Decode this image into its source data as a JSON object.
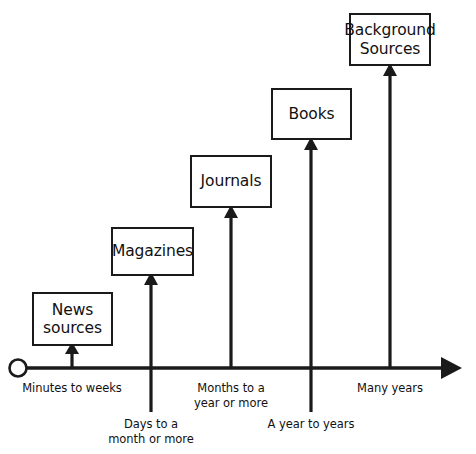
{
  "diagram": {
    "type": "information-timeline",
    "background_color": "#ffffff",
    "line_color": "#1a1a1a",
    "axis": {
      "name": "time-axis",
      "origin_marker": "open-circle",
      "direction": "left-to-right",
      "arrowhead": "right"
    },
    "stages": [
      {
        "box_label": "News\nsources",
        "axis_label": "Minutes to weeks",
        "label_position": "above-axis"
      },
      {
        "box_label": "Magazines",
        "axis_label": "Days to a\nmonth or more",
        "label_position": "below-axis"
      },
      {
        "box_label": "Journals",
        "axis_label": "Months to a\nyear or more",
        "label_position": "above-axis"
      },
      {
        "box_label": "Books",
        "axis_label": "A year to years",
        "label_position": "below-axis"
      },
      {
        "box_label": "Background\nSources",
        "axis_label": "Many years",
        "label_position": "above-axis"
      }
    ]
  }
}
